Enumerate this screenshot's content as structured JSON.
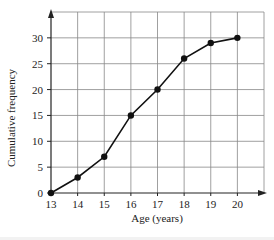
{
  "chart_data": {
    "type": "line",
    "title": "",
    "xlabel": "Age (years)",
    "ylabel": "Cumulative frequency",
    "x": [
      13,
      14,
      15,
      16,
      17,
      18,
      19,
      20
    ],
    "categories": [
      "13",
      "14",
      "15",
      "16",
      "17",
      "18",
      "19",
      "20"
    ],
    "values": [
      0,
      3,
      7,
      15,
      20,
      26,
      29,
      30
    ],
    "series": [
      {
        "name": "Cumulative frequency",
        "values": [
          0,
          3,
          7,
          15,
          20,
          26,
          29,
          30
        ]
      }
    ],
    "xlim": [
      13,
      21
    ],
    "ylim": [
      0,
      35
    ],
    "x_ticks": [
      "13",
      "14",
      "15",
      "16",
      "17",
      "18",
      "19",
      "20"
    ],
    "y_ticks": [
      "0",
      "5",
      "10",
      "15",
      "20",
      "25",
      "30"
    ],
    "grid": true,
    "markers": true,
    "legend": "none"
  },
  "colors": {
    "line": "#111111",
    "grid": "#888888",
    "axis": "#222222",
    "background": "#ffffff"
  }
}
